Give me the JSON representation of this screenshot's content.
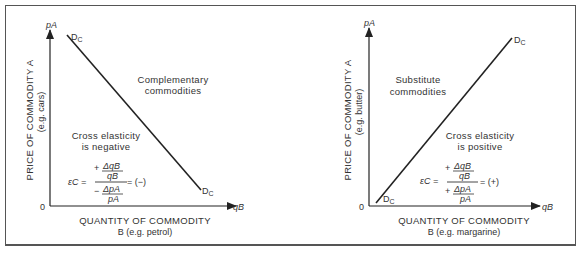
{
  "figures": [
    {
      "id": "complementary",
      "y_axis_title": "PRICE OF COMMODITY A",
      "y_axis_subtitle": "(e.g. cars)",
      "y_axis_symbol": "pA",
      "x_axis_title": "QUANTITY OF COMMODITY",
      "x_axis_subtitle": "B (e.g. petrol)",
      "x_axis_symbol": "qB",
      "origin_label": "0",
      "curve_label_start": "DC",
      "curve_label_end": "DC",
      "region_label_line1": "Complementary",
      "region_label_line2": "commodities",
      "elasticity_line1": "Cross elasticity",
      "elasticity_line2": "is negative",
      "formula": {
        "lhs": "εC =",
        "num_sign": "+",
        "num_top": "ΔqB",
        "num_bottom": "qB",
        "den_sign": "−",
        "den_top": "ΔpA",
        "den_bottom": "pA",
        "result": "= (−)"
      },
      "slope": "negative"
    },
    {
      "id": "substitute",
      "y_axis_title": "PRICE OF COMMODITY A",
      "y_axis_subtitle": "(e.g. butter)",
      "y_axis_symbol": "pA",
      "x_axis_title": "QUANTITY OF COMMODITY",
      "x_axis_subtitle": "B (e.g. margarine)",
      "x_axis_symbol": "qB",
      "origin_label": "0",
      "curve_label_start": "DC",
      "curve_label_end": "DC",
      "region_label_line1": "Substitute",
      "region_label_line2": "commodities",
      "elasticity_line1": "Cross elasticity",
      "elasticity_line2": "is positive",
      "formula": {
        "lhs": "εC =",
        "num_sign": "+",
        "num_top": "ΔqB",
        "num_bottom": "qB",
        "den_sign": "+",
        "den_top": "ΔpA",
        "den_bottom": "pA",
        "result": "= (+)"
      },
      "slope": "positive"
    }
  ],
  "colors": {
    "line": "#222222",
    "text": "#333333",
    "frame": "#555555"
  }
}
